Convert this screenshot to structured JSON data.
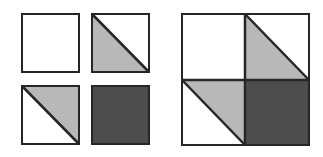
{
  "colors": {
    "background": "#ffffff",
    "stroke": "#262626",
    "light_fill": "#b8b8b8",
    "dark_fill": "#4d4d4d",
    "white_fill": "#ffffff"
  },
  "small_tiles": [
    {
      "name": "tile-white",
      "position": "top-left",
      "fill": "white"
    },
    {
      "name": "tile-half-lower-left",
      "position": "top-right",
      "fill": "light triangle lower-left"
    },
    {
      "name": "tile-half-upper-right",
      "position": "bottom-left",
      "fill": "light triangle upper-right"
    },
    {
      "name": "tile-dark",
      "position": "bottom-right",
      "fill": "dark"
    }
  ],
  "assembled_block": {
    "description": "Four tiles assembled into a 2x2 block",
    "quadrants": [
      "white",
      "light triangle lower-left",
      "light triangle upper-right",
      "dark"
    ]
  }
}
